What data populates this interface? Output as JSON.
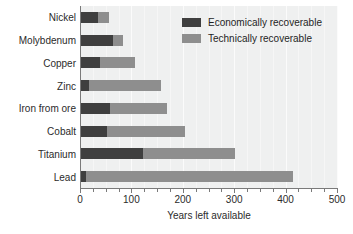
{
  "chart_data": {
    "type": "bar",
    "orientation": "horizontal",
    "stacked": true,
    "title": "",
    "xlabel": "Years left available",
    "ylabel": "",
    "xlim": [
      0,
      500
    ],
    "xticks": [
      0,
      100,
      200,
      300,
      400,
      500
    ],
    "xtick_labels": [
      "0",
      "100",
      "200",
      "300",
      "400",
      "500"
    ],
    "minor_tick_interval": 25,
    "grid": true,
    "grid_axis": "x",
    "legend_position": "top-right",
    "categories": [
      "Nickel",
      "Molybdenum",
      "Copper",
      "Zinc",
      "Iron from ore",
      "Cobalt",
      "Titanium",
      "Lead"
    ],
    "series": [
      {
        "name": "Economically recoverable",
        "color": "#3f3f3f",
        "values": [
          35,
          65,
          38,
          18,
          59,
          53,
          122,
          12
        ]
      },
      {
        "name": "Technically recoverable",
        "color": "#8e8e8e",
        "values": [
          22,
          19,
          69,
          140,
          111,
          152,
          179,
          402
        ]
      }
    ],
    "totals": [
      57,
      84,
      107,
      158,
      170,
      205,
      301,
      414
    ],
    "colors": {
      "plot_background": "#eff0f0",
      "gridline": "#fbfbfb",
      "axis_line": "#7a7a7a",
      "text": "#2b2b2b",
      "economically_recoverable": "#3f3f3f",
      "technically_recoverable": "#8e8e8e"
    }
  },
  "legend": {
    "items": [
      {
        "label": "Economically recoverable"
      },
      {
        "label": "Technically recoverable"
      }
    ]
  }
}
